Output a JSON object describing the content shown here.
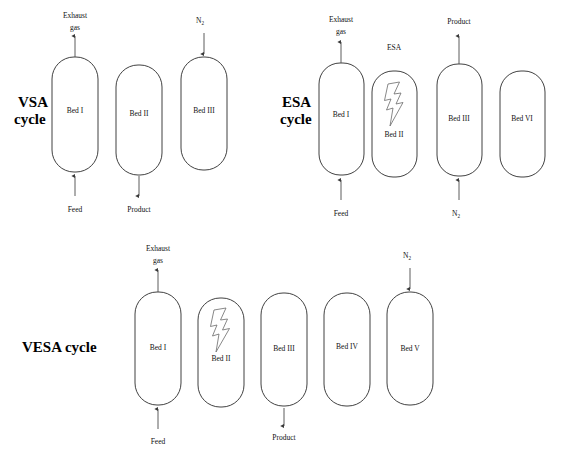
{
  "figure": {
    "background": "#ffffff",
    "stroke_color": "#2b2b2b",
    "flow_color": "#4a4a4a"
  },
  "rows": [
    {
      "id": "vsa",
      "cycle_label_line1": "VSA",
      "cycle_label_line2": "cycle",
      "beds": [
        {
          "label": "Bed I",
          "has_bolt": false
        },
        {
          "label": "Bed II",
          "has_bolt": false
        },
        {
          "label": "Bed III",
          "has_bolt": false
        }
      ],
      "streams": [
        {
          "label_line1": "Exhaust",
          "label_line2": "gas",
          "direction": "out-top",
          "bed": "Bed I"
        },
        {
          "label_line1": "Feed",
          "label_line2": "",
          "direction": "in-bottom",
          "bed": "Bed I"
        },
        {
          "label_line1": "Product",
          "label_line2": "",
          "direction": "out-bottom",
          "bed": "Bed II"
        },
        {
          "label_line1": "N",
          "label_sub": "2",
          "direction": "in-top",
          "bed": "Bed III"
        }
      ]
    },
    {
      "id": "esa",
      "cycle_label_line1": "ESA",
      "cycle_label_line2": "cycle",
      "esa_tag": "ESA",
      "beds": [
        {
          "label": "Bed I",
          "has_bolt": false
        },
        {
          "label": "Bed II",
          "has_bolt": true
        },
        {
          "label": "Bed III",
          "has_bolt": false
        },
        {
          "label": "Bed VI",
          "has_bolt": false
        }
      ],
      "streams": [
        {
          "label_line1": "Exhaust",
          "label_line2": "gas",
          "direction": "out-top",
          "bed": "Bed I"
        },
        {
          "label_line1": "Feed",
          "label_line2": "",
          "direction": "in-bottom",
          "bed": "Bed I"
        },
        {
          "label_line1": "Product",
          "label_line2": "",
          "direction": "out-top",
          "bed": "Bed III"
        },
        {
          "label_line1": "N",
          "label_sub": "2",
          "direction": "in-bottom",
          "bed": "Bed III"
        }
      ]
    },
    {
      "id": "vesa",
      "cycle_label_line1": "VESA cycle",
      "cycle_label_line2": "",
      "beds": [
        {
          "label": "Bed I",
          "has_bolt": false
        },
        {
          "label": "Bed II",
          "has_bolt": true
        },
        {
          "label": "Bed III",
          "has_bolt": false
        },
        {
          "label": "Bed IV",
          "has_bolt": false
        },
        {
          "label": "Bed V",
          "has_bolt": false
        }
      ],
      "streams": [
        {
          "label_line1": "Exhaust",
          "label_line2": "gas",
          "direction": "out-top",
          "bed": "Bed I"
        },
        {
          "label_line1": "Feed",
          "label_line2": "",
          "direction": "in-bottom",
          "bed": "Bed I"
        },
        {
          "label_line1": "Product",
          "label_line2": "",
          "direction": "out-bottom",
          "bed": "Bed III"
        },
        {
          "label_line1": "N",
          "label_sub": "2",
          "direction": "in-top",
          "bed": "Bed V"
        }
      ]
    }
  ]
}
